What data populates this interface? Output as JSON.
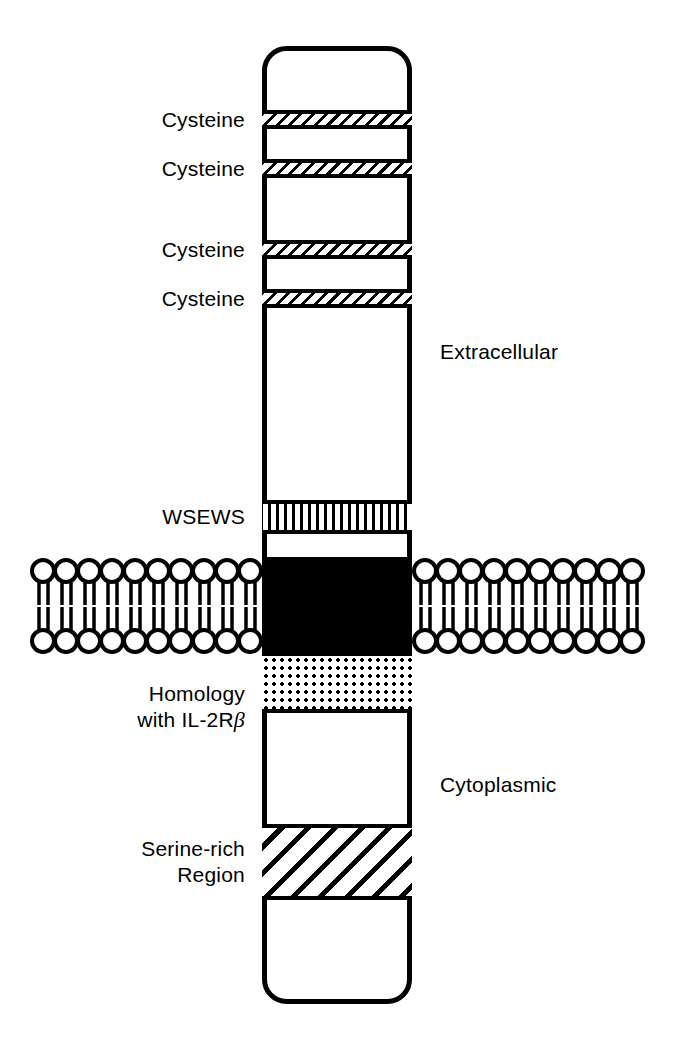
{
  "diagram": {
    "colors": {
      "ink": "#000000",
      "paper": "#ffffff"
    },
    "compartments": [
      {
        "name": "extracellular",
        "label": "Extracellular",
        "x": 440,
        "y": 352
      },
      {
        "name": "cytoplasmic",
        "label": "Cytoplasmic",
        "x": 440,
        "y": 785
      }
    ],
    "domains": [
      {
        "id": "cysteine-1",
        "label": "Cysteine",
        "pattern": "diagonal-hatch-thin",
        "top": 110,
        "height": 19,
        "label_x": 245,
        "label_y": 120,
        "label_align": "right",
        "lines": [
          "Cysteine"
        ]
      },
      {
        "id": "cysteine-2",
        "label": "Cysteine",
        "pattern": "diagonal-hatch-thin",
        "top": 159,
        "height": 19,
        "label_x": 245,
        "label_y": 169,
        "label_align": "right",
        "lines": [
          "Cysteine"
        ]
      },
      {
        "id": "cysteine-3",
        "label": "Cysteine",
        "pattern": "diagonal-hatch-thin",
        "top": 240,
        "height": 19,
        "label_x": 245,
        "label_y": 250,
        "label_align": "right",
        "lines": [
          "Cysteine"
        ]
      },
      {
        "id": "cysteine-4",
        "label": "Cysteine",
        "pattern": "diagonal-hatch-thin",
        "top": 289,
        "height": 19,
        "label_x": 245,
        "label_y": 299,
        "label_align": "right",
        "lines": [
          "Cysteine"
        ]
      },
      {
        "id": "wsews",
        "label": "WSEWS",
        "pattern": "vertical-stripes",
        "top": 500,
        "height": 34,
        "label_x": 245,
        "label_y": 517,
        "label_align": "right",
        "lines": [
          "WSEWS"
        ]
      },
      {
        "id": "transmembrane",
        "label": "",
        "pattern": "solid-black",
        "top": 557,
        "height": 99,
        "label_x": 0,
        "label_y": 0,
        "label_align": "none",
        "lines": []
      },
      {
        "id": "homology-il2rb",
        "label": "Homology with IL-2Rβ",
        "pattern": "dotted-stipple",
        "top": 656,
        "height": 57,
        "label_x": 245,
        "label_y": 707,
        "label_align": "right",
        "lines": [
          "Homology",
          "with IL-2R"
        ],
        "line2_suffix_greek": "β"
      },
      {
        "id": "serine-rich",
        "label": "Serine-rich Region",
        "pattern": "diagonal-hatch-wide",
        "top": 824,
        "height": 76,
        "label_x": 245,
        "label_y": 862,
        "label_align": "right",
        "lines": [
          "Serine-rich",
          "Region"
        ]
      }
    ],
    "membrane": {
      "name": "lipid-bilayer",
      "left_segment": {
        "x": 30,
        "width": 232,
        "lipid_count": 10
      },
      "right_segment": {
        "x": 412,
        "width": 243,
        "lipid_count": 10
      },
      "top": 556,
      "height": 100
    },
    "receptor_body": {
      "x": 262,
      "y": 46,
      "width": 150,
      "height": 958,
      "corner_radius": 22,
      "stroke_width": 5
    }
  }
}
